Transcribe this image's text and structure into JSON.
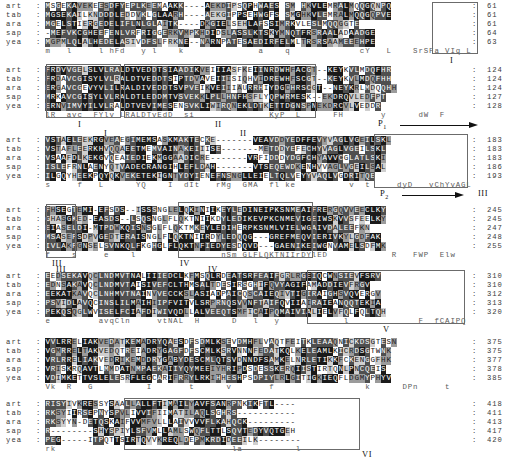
{
  "figure": {
    "type": "multiple-sequence-alignment",
    "n_sequences": 5,
    "n_blocks": 7,
    "labels": [
      "art",
      "tab",
      "ara",
      "sap",
      "yea"
    ],
    "separator": ":",
    "motif_labels": [
      "I",
      "II",
      "III",
      "IV",
      "V",
      "VI"
    ],
    "arrow_labels": [
      "P1",
      "P2"
    ]
  },
  "blocks": [
    {
      "id": "block-1",
      "rows": [
        {
          "label": "art",
          "seq": "MSGEKAVEKEESDFYEPLKEEMAAKK----AEKDIPSQPHWAES SM HKVLEMRALMQQGQNPQ",
          "end": "61"
        },
        {
          "label": "tab",
          "seq": "MGSEKAILKNDDDLEDDVKLGLAARH----AEKGIPPSEHWGFS SMGHKVLEMRALMQQGQPVE",
          "end": "61"
        },
        {
          "label": "ara",
          "seq": "MGELSTIERGEDELIFLNLGLAITK----DKGIELSEHLAFSSIMRKVLESLMQQGGTE",
          "end": "61"
        },
        {
          "label": "sap",
          "seq": "-MEFVKCGHEEFENLVRFRIGGERKVMPKHDIDSLASSLKTSKYMNQTFRSRAALADAADGE",
          "end": "64"
        },
        {
          "label": "yea",
          "seq": "MGPMLQLALHEDELASIVDFSLFRKNE--NARNPATESAEDIRFELMLTRSRSAAMEEEHPE",
          "end": "63"
        }
      ],
      "consensus": "m   l     l hFd   y l    k              a    q             cY   L    SrSFa VIq L   e"
    },
    {
      "id": "block-2",
      "rows": [
        {
          "label": "art",
          "seq": "FRDVVGELSLVLRALDTVEDDTSIAADIKVEIIIASFKEIINRDWHFACGT--KEYKVLMDQFHR",
          "end": "124"
        },
        {
          "label": "tab",
          "seq": "FRDAVCGISYLVLRALDTVEDDTSIPTDVAVEIIISIQHVIDREWHFSCGT--KEYKVLMDQFHH",
          "end": "124"
        },
        {
          "label": "ara",
          "seq": "ERGAVCGEVYVLILRALDIVEDDTSVPVEIKVEIIIAURRHIYDGCHRSCGT--NEYKRLMDQQHH",
          "end": "124"
        },
        {
          "label": "sap",
          "seq": "MRKAVCGISYLVLRALDTLEDDMTVSVEKKLPLLHNFHSFLYQPWRMESK--EKDRQVLEDFPT",
          "end": "127"
        },
        {
          "label": "yea",
          "seq": "ERNVIMVYILVLRALDTVEVIMESENSVKLIWIRQNEKLDTKETTDGNSPNEKDRCVLVEDDR",
          "end": "128"
        }
      ],
      "consensus": "lR  avc  FYlv LRALDTvEdD  si              KyP  L      FH       y      dW  F                   F"
    },
    {
      "id": "block-3",
      "rows": [
        {
          "label": "art",
          "seq": "VSTAELEEKRGVEAEGIMEMSASKMAKTECKE-------VEAVDDYEDFFEVYVAGLVGEILSKL",
          "end": "183"
        },
        {
          "label": "tab",
          "seq": "VSTAFLEERKHVQQAEETMEMVAINAKEIIISE-------METDDYEFECHYVAGLVGEILSKL",
          "end": "183"
        },
        {
          "label": "ara",
          "seq": "VSAAFDLKEKGVQEAIEDIEKMGGAADICRE-------VRFIDDDYDGFCHYAVVCGLATLSKI",
          "end": "183"
        },
        {
          "label": "sap",
          "seq": "ISLEFRNLAENYQTVADECRANGIHLEFLDAH-------VTSEQEWDKENHVVAGLVGEILSAL",
          "end": "186"
        },
        {
          "label": "yea",
          "seq": "ILGQYHEEKPQYQKVEKETEKIGNTYDYIENEFNSNGLLEIELTQLVEYYVAQLVGDRITQE",
          "end": "193"
        }
      ],
      "consensus": "s     f   L      YQ    I  dIt   rMg  GMA  fl ke          v  t     dyD   vChYvAGLVG GLs l"
    },
    {
      "id": "block-4",
      "rows": [
        {
          "label": "art",
          "seq": "FHSEGTEMI-EFSDS--ISSSNGLELQKINIIKEYLEDINEIPKSNMEAIFRERGQVVEECLKY",
          "end": "245"
        },
        {
          "label": "tab",
          "seq": "GHASGKED-EASDS--LSQSNGLFLQKTNIIKDYLEDIKEVPKCNMEVIGEIWSKVVSFEELKY",
          "end": "245"
        },
        {
          "label": "ara",
          "seq": "EIASELDI-MTPDWKQISNSGLFLQKTMKEYLEDIHERPKSNMLVIELWGAIVDALEEFKN",
          "end": "247"
        },
        {
          "label": "sap",
          "seq": "MSASEFSDPVGEDTERAISNGLFLQKTNIIRDYLEDQQG---GREFMEQVIERIVKYLGDFAK",
          "end": "248"
        },
        {
          "label": "yea",
          "seq": "IVLAKFGNSELSVNKQLFKGHGLFLQKTNFIEDYESDQVD---GAENIKEIWGNVAMELSDFMK",
          "end": "255"
        }
      ],
      "consensus": "f    s     e    l                nSm GLFLQKTNIIrDYlED            R   FWP  Elw    kYy    kL   d"
    },
    {
      "id": "block-5",
      "rows": [
        {
          "label": "art",
          "seq": "EEDSEKAVQCLNDMVTNALIIIEDCLKFMSQLRDEATSRFEAIFGRLRGEIQCWNSIEVFSRV",
          "end": "310"
        },
        {
          "label": "tab",
          "seq": "EDNSAKAVQCLNDMVTAISIVEFCLTHMSALTDESIRSGHIFQVYAGIFAMADDIEVFRGV",
          "end": "310"
        },
        {
          "label": "ara",
          "seq": "EEKATKAVQCLNHMVTNAINVVECCKSLASIADPAICQSCAIEQIVTIGIRAIGHSVQVERGV",
          "end": "312"
        },
        {
          "label": "sap",
          "seq": "PSVIDLAVQCINSLILMAIHIIPFVITVLSRPRNQSVVNFTAIFQVIIAIRAIEANQQTEKIA",
          "end": "313"
        },
        {
          "label": "yea",
          "seq": "PEKQSQGLWVISELFCIAFDIWIVQDLLALVEEQTSMFICAIPQMAIVIALIELVFQLFQLTQH",
          "end": "320"
        }
      ],
      "consensus": "e         avqCln     vtNAL  H      D   l   y            l             F  fCAIPQ  mAI  TLa   cy   N    Vf  g"
    },
    {
      "id": "block-6",
      "rows": [
        {
          "label": "art",
          "seq": "VVLRRELIAKVEDATKEMADRYQAESDFSDMLKSEVDMHFLVAQTFEITKLEAAQNICKDSGTESN",
          "end": "375"
        },
        {
          "label": "tab",
          "seq": "VGMRRELTAKVEDQTREIADRYGAGFDFSCMLKSRVNNNFEDATKQLKELEAMLKICRDSGTWNK",
          "end": "375"
        },
        {
          "label": "ara",
          "seq": "VRLRRELIAKVEDRIKEMDDRYGABYDESCMLQTSVDNNDFSAMKELNRLETIKKFCKENGGFHK",
          "end": "377"
        },
        {
          "label": "sap",
          "seq": "VRISKRQAVTLMMDATNMPAEKAIIYQYMEEIYHRIPDSDESSKERQIISTIRTQNLPNCQEIS",
          "end": "378"
        },
        {
          "label": "yea",
          "seq": "VDIMKETTVSLELESRFLEGCARIFRRYLRKIHHESHPSDPIYLRLGITIGKIEQFLDGMYPHYV",
          "end": "385"
        }
      ],
      "consensus": "Vk  R   G          I       t      v       f                 k      DPn     t               l"
    },
    {
      "id": "block-7",
      "rows": [
        {
          "label": "art",
          "seq": "RISYIVKRESSYSAALLALLFTIMAILYAVFSANRPNKIKFTL----",
          "end": "418"
        },
        {
          "label": "tab",
          "seq": "RKSYIIRSEPNYSPVLIVVIFIIMATILAQLSGHRS-----------",
          "end": "411"
        },
        {
          "label": "ara",
          "seq": "RKSYYN-DETQSKAIFVVMFVLLLAIVVVVFLKAHQCK---------",
          "end": "413"
        },
        {
          "label": "sap",
          "seq": "R--------SHYSPIYLSFVMLLAMLSWQFLTTLSQVTEDYVQTGEH",
          "end": "417"
        },
        {
          "label": "yea",
          "seq": "PEG-----ITPQTTSIRTQVVKREQLDEPMKRDIDEEILK--------",
          "end": "420"
        }
      ],
      "consensus": "rk                                 la          l"
    }
  ],
  "annotations": {
    "motif_I_b1": "I",
    "motif_I_b2": "I",
    "motif_II_b2": "II",
    "motif_I_b3": "I",
    "motif_II_b3": "II",
    "motif_III_b3": "III",
    "motif_III_b4": "III",
    "motif_IV_b4": "IV",
    "motif_III_b5": "III",
    "motif_IV_b5": "IV",
    "motif_V_b5": "V",
    "motif_VI_b7": "VI",
    "P1": "P",
    "P1_sub": "1",
    "P2": "P",
    "P2_sub": "2"
  }
}
